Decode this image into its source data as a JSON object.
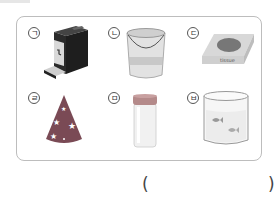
{
  "choices": [
    {
      "label": "ㄱ",
      "object": "coffee-machine",
      "shape": "rectangular prism"
    },
    {
      "label": "ㄴ",
      "object": "paint-bucket",
      "shape": "cylinder"
    },
    {
      "label": "ㄷ",
      "object": "tissue-box",
      "shape": "rectangular prism",
      "box_text": "tissue"
    },
    {
      "label": "ㄹ",
      "object": "party-hat",
      "shape": "cone"
    },
    {
      "label": "ㅁ",
      "object": "vial-with-cap",
      "shape": "cylinder"
    },
    {
      "label": "ㅂ",
      "object": "glass-beaker-with-fish",
      "shape": "cylinder"
    }
  ],
  "answer": {
    "open_paren": "(",
    "close_paren": ")",
    "value": ""
  },
  "colors": {
    "border": "#bdbdbd",
    "dark": "#222222",
    "cone": "#7a4a55",
    "cap": "#b48a8a"
  }
}
